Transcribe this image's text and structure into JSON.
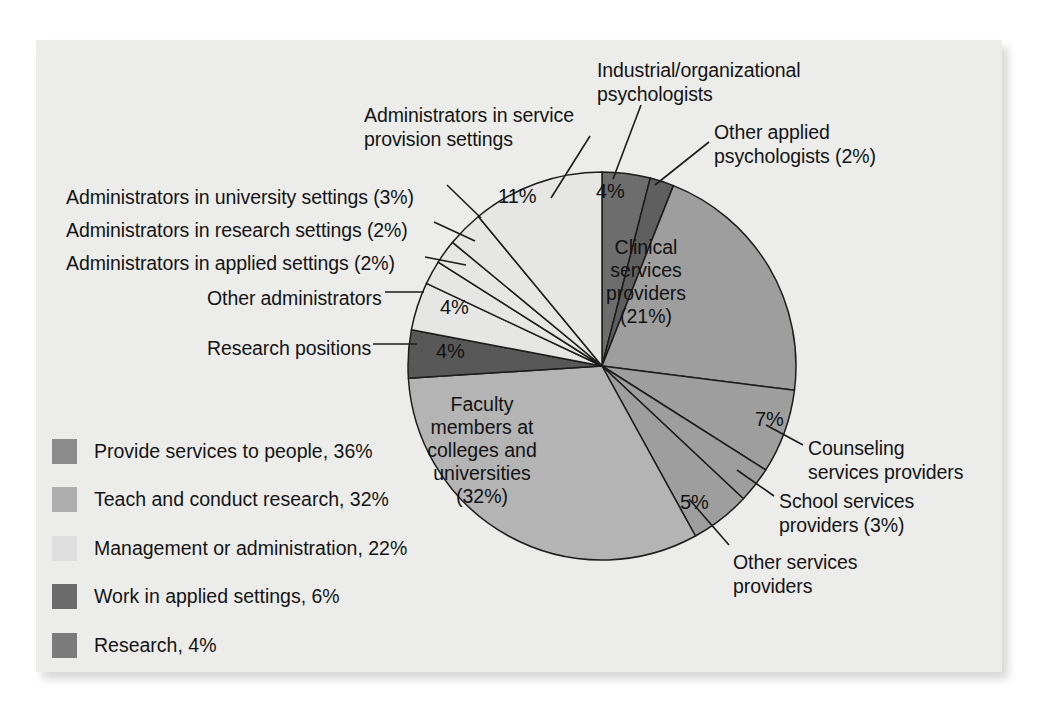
{
  "figure": {
    "background": "#ececeb",
    "page_background": "#ffffff"
  },
  "chart_data": {
    "type": "pie",
    "title": "",
    "total": 100,
    "units": "percent",
    "start_angle_deg": 0,
    "direction": "clockwise",
    "legend_position": "lower-left",
    "categories": [
      "Industrial/organizational psychologists",
      "Other applied psychologists",
      "Clinical services providers",
      "Counseling services providers",
      "School services providers",
      "Other services providers",
      "Faculty members at colleges and universities",
      "Research positions",
      "Other administrators",
      "Administrators in applied settings",
      "Administrators in research settings",
      "Administrators in university settings",
      "Administrators in service provision settings"
    ],
    "values": [
      4,
      2,
      21,
      7,
      3,
      5,
      32,
      4,
      4,
      2,
      2,
      3,
      11
    ],
    "slice_colors": [
      "#6d6d6d",
      "#5f5f5f",
      "#9e9e9e",
      "#9e9e9e",
      "#9e9e9e",
      "#9e9e9e",
      "#b4b4b4",
      "#585858",
      "#e6e6e4",
      "#e6e6e4",
      "#e6e6e4",
      "#e6e6e4",
      "#e6e6e4"
    ],
    "slice_value_labels": [
      "4%",
      "2%",
      "21%",
      "7%",
      "3%",
      "5%",
      "32%",
      "4%",
      "4%",
      "2%",
      "2%",
      "3%",
      "11%"
    ]
  },
  "pie": {
    "center_x": 602,
    "center_y": 366,
    "radius": 194,
    "inside_labels": [
      {
        "name": "clinical-services-providers",
        "text": "Clinical\nservices\nproviders\n(21%)",
        "x": 646,
        "y": 236
      },
      {
        "name": "faculty-members",
        "text": "Faculty\nmembers at\ncolleges and\nuniversities\n(32%)",
        "x": 482,
        "y": 393
      }
    ],
    "value_labels": [
      {
        "name": "industrial-organizational-pct",
        "text": "4%",
        "x": 596,
        "y": 181
      },
      {
        "name": "service-provision-admins-pct",
        "text": "11%",
        "x": 498,
        "y": 186
      },
      {
        "name": "other-administrators-pct",
        "text": "4%",
        "x": 440,
        "y": 297
      },
      {
        "name": "research-positions-pct",
        "text": "4%",
        "x": 436,
        "y": 341
      },
      {
        "name": "counseling-services-pct",
        "text": "7%",
        "x": 755,
        "y": 409
      },
      {
        "name": "other-services-pct",
        "text": "5%",
        "x": 680,
        "y": 492
      }
    ]
  },
  "callouts": [
    {
      "name": "industrial-organizational-psychologists",
      "text": "Industrial/organizational\npsychologists",
      "x": 597,
      "y": 59,
      "align": "left"
    },
    {
      "name": "other-applied-psychologists",
      "text": "Other applied\npsychologists (2%)",
      "x": 714,
      "y": 121,
      "align": "left"
    },
    {
      "name": "administrators-in-service-provision-settings",
      "text": "Administrators in service\nprovision settings",
      "x": 364,
      "y": 104,
      "align": "left"
    },
    {
      "name": "administrators-in-university-settings",
      "text": "Administrators in university settings (3%)",
      "x": 66,
      "y": 186,
      "align": "left"
    },
    {
      "name": "administrators-in-research-settings",
      "text": "Administrators in research settings (2%)",
      "x": 66,
      "y": 219,
      "align": "left"
    },
    {
      "name": "administrators-in-applied-settings",
      "text": "Administrators in applied settings (2%)",
      "x": 66,
      "y": 252,
      "align": "left"
    },
    {
      "name": "other-administrators",
      "text": "Other administrators",
      "x": 207,
      "y": 287,
      "align": "left"
    },
    {
      "name": "research-positions",
      "text": "Research positions",
      "x": 207,
      "y": 337,
      "align": "left"
    },
    {
      "name": "counseling-services-providers",
      "text": "Counseling\nservices providers",
      "x": 808,
      "y": 437,
      "align": "left"
    },
    {
      "name": "school-services-providers",
      "text": "School services\nproviders (3%)",
      "x": 779,
      "y": 490,
      "align": "left"
    },
    {
      "name": "other-services-providers",
      "text": "Other services\nproviders",
      "x": 733,
      "y": 551,
      "align": "left"
    }
  ],
  "legend": {
    "items": [
      {
        "label": "Provide services to people, 36%",
        "color": "#8c8c8c",
        "value": 36
      },
      {
        "label": "Teach and conduct research, 32%",
        "color": "#adadad",
        "value": 32
      },
      {
        "label": "Management or administration, 22%",
        "color": "#dedede",
        "value": 22
      },
      {
        "label": "Work in applied settings, 6%",
        "color": "#6b6b6b",
        "value": 6
      },
      {
        "label": "Research, 4%",
        "color": "#7b7b7b",
        "value": 4
      }
    ]
  }
}
